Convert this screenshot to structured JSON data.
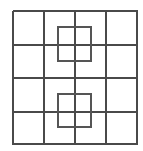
{
  "figure": {
    "type": "line-drawing",
    "canvas": {
      "width": 143,
      "height": 151,
      "background_color": "#ffffff"
    },
    "grid": {
      "label": "outer-grid",
      "columns": 4,
      "rows": 4,
      "line_color": "#4a4a4a",
      "line_width": 2,
      "x_positions": [
        13,
        44,
        75,
        106,
        138
      ],
      "y_positions": [
        11,
        45,
        78,
        112,
        145
      ],
      "left": 13,
      "right": 138,
      "top": 11,
      "bottom": 145,
      "cell_width": 31,
      "cell_height": 33
    },
    "inner_squares": [
      {
        "label": "upper-inner-square",
        "x": 58,
        "y": 27,
        "width": 33,
        "height": 34,
        "line_color": "#555555",
        "line_width": 2,
        "centered_on_intersection": "column-3-row-2"
      },
      {
        "label": "lower-inner-square",
        "x": 58,
        "y": 94,
        "width": 33,
        "height": 33,
        "line_color": "#555555",
        "line_width": 2,
        "centered_on_intersection": "column-3-row-4"
      }
    ]
  }
}
